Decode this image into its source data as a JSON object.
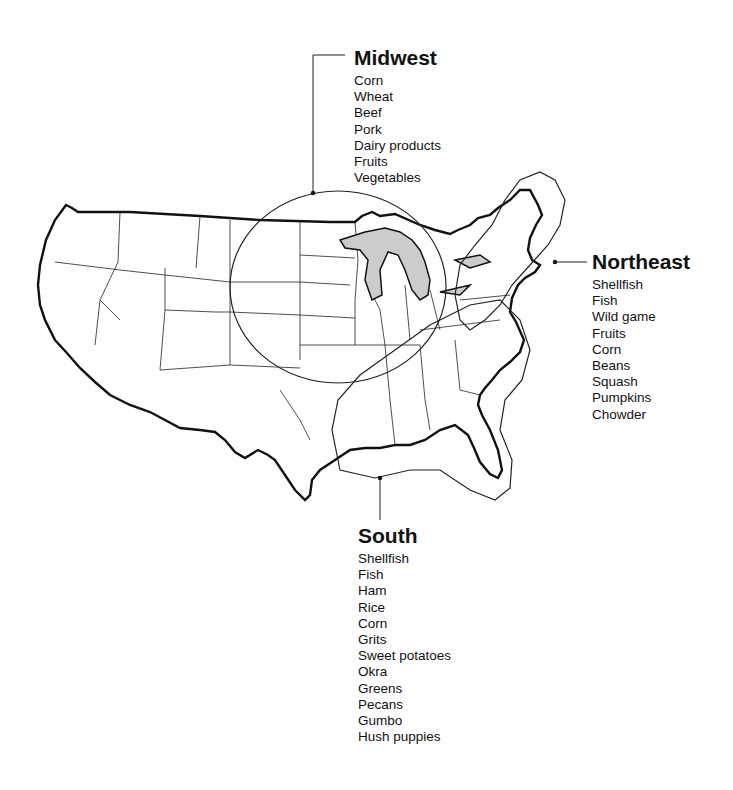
{
  "regions": {
    "midwest": {
      "title": "Midwest",
      "items": [
        "Corn",
        "Wheat",
        "Beef",
        "Pork",
        "Dairy products",
        "Fruits",
        "Vegetables"
      ]
    },
    "northeast": {
      "title": "Northeast",
      "items": [
        "Shellfish",
        "Fish",
        "Wild game",
        "Fruits",
        "Corn",
        "Beans",
        "Squash",
        "Pumpkins",
        "Chowder"
      ]
    },
    "south": {
      "title": "South",
      "items": [
        "Shellfish",
        "Fish",
        "Ham",
        "Rice",
        "Corn",
        "Grits",
        "Sweet potatoes",
        "Okra",
        "Greens",
        "Pecans",
        "Gumbo",
        "Hush puppies"
      ]
    }
  }
}
